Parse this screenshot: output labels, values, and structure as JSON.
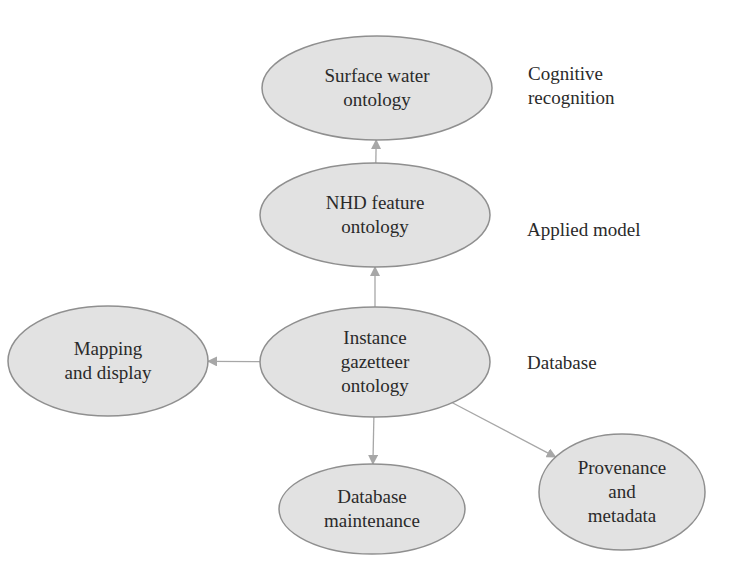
{
  "colors": {
    "node_fill": "#e2e2e2",
    "node_stroke": "#8f8f8f",
    "edge": "#a7a7a7",
    "text": "#2a2a2a",
    "background": "#ffffff"
  },
  "nodes": [
    {
      "id": "surface",
      "lines": [
        "Surface water",
        "ontology"
      ],
      "cx": 377,
      "cy": 88,
      "rx": 115,
      "ry": 52
    },
    {
      "id": "nhd",
      "lines": [
        "NHD feature",
        "ontology"
      ],
      "cx": 375,
      "cy": 215,
      "rx": 115,
      "ry": 52
    },
    {
      "id": "instance",
      "lines": [
        "Instance",
        "gazetteer",
        "ontology"
      ],
      "cx": 375,
      "cy": 362,
      "rx": 115,
      "ry": 55
    },
    {
      "id": "mapping",
      "lines": [
        "Mapping",
        "and display"
      ],
      "cx": 108,
      "cy": 361,
      "rx": 100,
      "ry": 55
    },
    {
      "id": "maintenance",
      "lines": [
        "Database",
        "maintenance"
      ],
      "cx": 372,
      "cy": 509,
      "rx": 93,
      "ry": 45
    },
    {
      "id": "provenance",
      "lines": [
        "Provenance",
        "and",
        "metadata"
      ],
      "cx": 622,
      "cy": 492,
      "rx": 83,
      "ry": 58
    }
  ],
  "edges": [
    {
      "from": "nhd",
      "to": "surface"
    },
    {
      "from": "instance",
      "to": "nhd"
    },
    {
      "from": "instance",
      "to": "mapping"
    },
    {
      "from": "instance",
      "to": "maintenance"
    },
    {
      "from": "instance",
      "to": "provenance"
    }
  ],
  "levels": {
    "cognitive": {
      "line1": "Cognitive",
      "line2": "recognition"
    },
    "applied": {
      "line1": "Applied model"
    },
    "database": {
      "line1": "Database"
    }
  }
}
